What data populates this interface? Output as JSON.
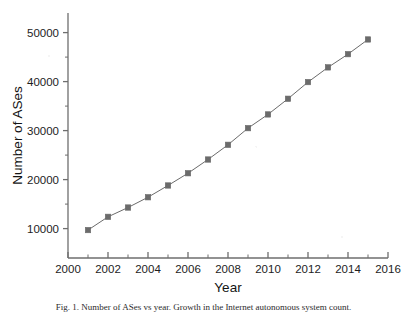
{
  "figure": {
    "background": "#ffffff",
    "axis_color": "#6e6e6e",
    "series_color": "#6b6b6b",
    "marker": "filled-square"
  },
  "caption": {
    "text": "Fig. 1.  Number of ASes vs year. Growth in the Internet autonomous system count.",
    "visible_fragment": "Fig. 1.  Number of ASes vs year. Growth in the Internet autonomous system count."
  },
  "chart_data": {
    "type": "line",
    "title": "",
    "xlabel": "Year",
    "ylabel": "Number of ASes",
    "xlim": [
      2000,
      2016
    ],
    "ylim": [
      4000,
      54000
    ],
    "grid": false,
    "legend": null,
    "x_ticks": [
      2000,
      2002,
      2004,
      2006,
      2008,
      2010,
      2012,
      2014,
      2016
    ],
    "x_tick_labels": [
      "2000",
      "2002",
      "2004",
      "2006",
      "2008",
      "2010",
      "2012",
      "2014",
      "2016"
    ],
    "x_minor_ticks": [
      2001,
      2003,
      2005,
      2007,
      2009,
      2011,
      2013,
      2015
    ],
    "y_ticks": [
      10000,
      20000,
      30000,
      40000,
      50000
    ],
    "y_tick_labels": [
      "10000",
      "20000",
      "30000",
      "40000",
      "50000"
    ],
    "y_minor_ticks": [
      15000,
      25000,
      35000,
      45000
    ],
    "x": [
      2001,
      2002,
      2003,
      2004,
      2005,
      2006,
      2007,
      2008,
      2009,
      2010,
      2011,
      2012,
      2013,
      2014,
      2015
    ],
    "values": [
      9700,
      12400,
      14300,
      16400,
      18800,
      21300,
      24100,
      27100,
      30500,
      33300,
      36500,
      39900,
      42900,
      45600,
      48600
    ],
    "series": [
      {
        "name": "Number of ASes",
        "marker": "square",
        "color": "#6b6b6b",
        "values": [
          9700,
          12400,
          14300,
          16400,
          18800,
          21300,
          24100,
          27100,
          30500,
          33300,
          36500,
          39900,
          42900,
          45600,
          48600
        ]
      }
    ]
  }
}
